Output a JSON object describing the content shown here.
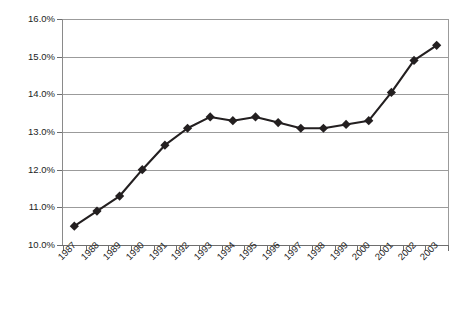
{
  "chart_data": {
    "type": "line",
    "title": "",
    "subtitle": "",
    "xlabel": "",
    "ylabel": "",
    "categories": [
      "1987",
      "1988",
      "1989",
      "1990",
      "1991",
      "1992",
      "1993",
      "1994",
      "1995",
      "1996",
      "1997",
      "1998",
      "1999",
      "2000",
      "2001",
      "2002",
      "2003"
    ],
    "values": [
      10.5,
      10.9,
      11.3,
      12.0,
      12.65,
      13.1,
      13.4,
      13.3,
      13.4,
      13.25,
      13.1,
      13.1,
      13.2,
      13.3,
      14.05,
      14.9,
      15.3
    ],
    "series": [
      {
        "name": "",
        "values": [
          10.5,
          10.9,
          11.3,
          12.0,
          12.65,
          13.1,
          13.4,
          13.3,
          13.4,
          13.25,
          13.1,
          13.1,
          13.2,
          13.3,
          14.05,
          14.9,
          15.3
        ]
      }
    ],
    "ylim": [
      10.0,
      16.0
    ],
    "ytick_values": [
      10.0,
      11.0,
      12.0,
      13.0,
      14.0,
      15.0,
      16.0
    ],
    "ytick_labels": [
      "10.0%",
      "11.0%",
      "12.0%",
      "13.0%",
      "14.0%",
      "15.0%",
      "16.0%"
    ],
    "value_suffix": "%",
    "grid": true,
    "grid_axis": "y",
    "legend": false,
    "legend_position": "none",
    "annotations": [],
    "marker": "diamond",
    "line_color": "#231f20",
    "marker_color": "#231f20",
    "grid_color": "#9b9b9b",
    "axis_color": "#6e6e6e",
    "background_color": "#ffffff"
  }
}
